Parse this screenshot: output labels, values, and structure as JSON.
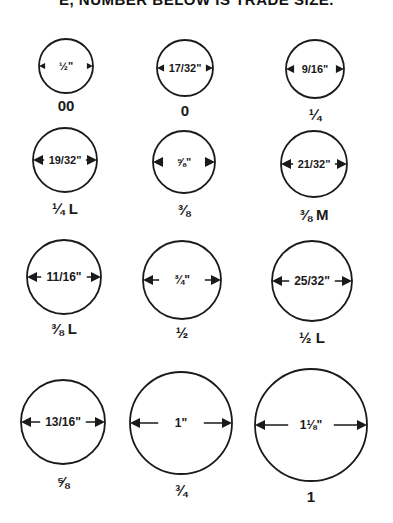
{
  "header": {
    "text": "E, NUMBER BELOW IS TRADE SIZE."
  },
  "rings": [
    {
      "diameter": "½\"",
      "diameter_in": 0.5,
      "trade_size": "00"
    },
    {
      "diameter": "17/32\"",
      "diameter_in": 0.53125,
      "trade_size": "0"
    },
    {
      "diameter": "9/16\"",
      "diameter_in": 0.5625,
      "trade_size": "¼"
    },
    {
      "diameter": "19/32\"",
      "diameter_in": 0.59375,
      "trade_size": "¼ L"
    },
    {
      "diameter": "⅝\"",
      "diameter_in": 0.625,
      "trade_size": "⅜"
    },
    {
      "diameter": "21/32\"",
      "diameter_in": 0.65625,
      "trade_size": "⅜ M"
    },
    {
      "diameter": "11/16\"",
      "diameter_in": 0.6875,
      "trade_size": "⅜ L"
    },
    {
      "diameter": "¾\"",
      "diameter_in": 0.75,
      "trade_size": "½"
    },
    {
      "diameter": "25/32\"",
      "diameter_in": 0.78125,
      "trade_size": "½ L"
    },
    {
      "diameter": "13/16\"",
      "diameter_in": 0.8125,
      "trade_size": "⅝"
    },
    {
      "diameter": "1\"",
      "diameter_in": 1.0,
      "trade_size": "¾"
    },
    {
      "diameter": "1⅛\"",
      "diameter_in": 1.125,
      "trade_size": "1"
    }
  ]
}
